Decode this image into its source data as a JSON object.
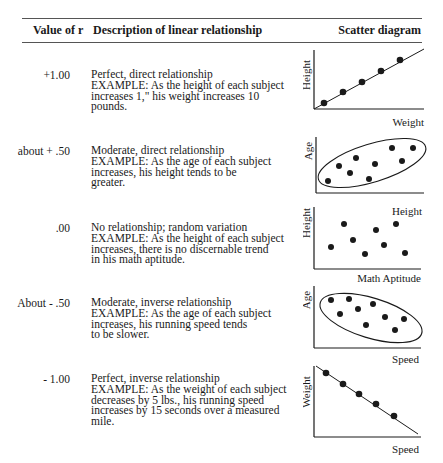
{
  "table": {
    "headers": {
      "value": "Value of r",
      "description": "Description of linear relationship",
      "scatter": "Scatter diagram"
    },
    "rows": [
      {
        "value": "+1.00",
        "lines": [
          "Perfect, direct relationship",
          "EXAMPLE: As the height of each subject",
          "increases 1,\" his weight increases 10",
          "pounds."
        ],
        "y_label": "Height",
        "x_label": "Weight"
      },
      {
        "value": "about + .50",
        "lines": [
          "Moderate, direct relationship",
          "EXAMPLE: As the age of each subject",
          "increases, his height tends to be",
          "greater."
        ],
        "y_label": "Age",
        "x_label": "Height"
      },
      {
        "value": ".00",
        "lines": [
          "No relationship; random variation",
          "EXAMPLE:  As the height of each subject",
          "increases, there is no discernable trend",
          "in his math aptitude."
        ],
        "y_label": "Height",
        "x_label": "Math Aptitude"
      },
      {
        "value": "About - .50",
        "lines": [
          "Moderate, inverse relationship",
          "EXAMPLE: As the age of each subject",
          "increases, his running speed tends",
          "to be slower."
        ],
        "y_label": "Age",
        "x_label": "Speed"
      },
      {
        "value": "- 1.00",
        "lines": [
          "Perfect, inverse relationship",
          "EXAMPLE: As the weight of each subject",
          "decreases by 5 lbs., his running speed",
          "increases by 15 seconds over a measured",
          "mile."
        ],
        "y_label": "Weight",
        "x_label": "Speed"
      }
    ]
  },
  "colors": {
    "ink": "#1a1a1a",
    "rule": "#555555",
    "background": "#ffffff"
  }
}
